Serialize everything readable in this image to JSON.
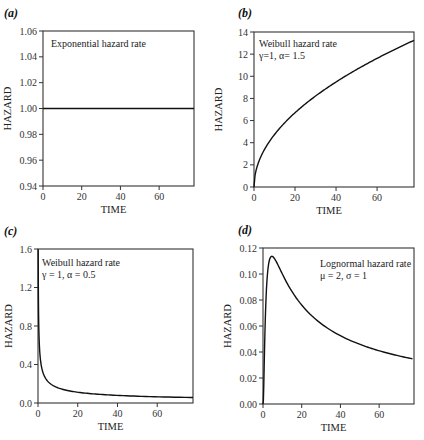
{
  "chart_data": [
    {
      "id": "a",
      "type": "line",
      "panel_label": "(a)",
      "title": "Exponential hazard rate",
      "annotation_lines": [
        "Exponential hazard rate"
      ],
      "xlabel": "TIME",
      "ylabel": "HAZARD",
      "xlim": [
        0,
        78
      ],
      "ylim": [
        0.94,
        1.06
      ],
      "xticks": [
        0,
        20,
        40,
        60
      ],
      "yticks": [
        "0.94",
        "0.96",
        "0.98",
        "1.00",
        "1.02",
        "1.04",
        "1.06"
      ],
      "grid": false,
      "series": [
        {
          "name": "Exponential",
          "formula": "h(t)=1",
          "x": [
            0,
            10,
            20,
            30,
            40,
            50,
            60,
            70,
            78
          ],
          "values": [
            1.0,
            1.0,
            1.0,
            1.0,
            1.0,
            1.0,
            1.0,
            1.0,
            1.0
          ]
        }
      ]
    },
    {
      "id": "b",
      "type": "line",
      "panel_label": "(b)",
      "title": "Weibull hazard rate",
      "annotation_lines": [
        "Weibull hazard rate",
        "γ=1,  α= 1.5"
      ],
      "xlabel": "TIME",
      "ylabel": "HAZARD",
      "xlim": [
        0,
        78
      ],
      "ylim": [
        0,
        14
      ],
      "xticks": [
        0,
        20,
        40,
        60
      ],
      "yticks": [
        "0",
        "2",
        "4",
        "6",
        "8",
        "10",
        "12",
        "14"
      ],
      "grid": false,
      "series": [
        {
          "name": "Weibull γ=1, α=1.5",
          "x": [
            0,
            1,
            2,
            5,
            10,
            20,
            30,
            40,
            50,
            60,
            70,
            78
          ],
          "values": [
            0,
            1.5,
            2.12,
            3.35,
            4.74,
            6.71,
            8.22,
            9.49,
            10.61,
            11.62,
            12.55,
            13.25
          ]
        }
      ]
    },
    {
      "id": "c",
      "type": "line",
      "panel_label": "(c)",
      "title": "Weibull hazard rate",
      "annotation_lines": [
        "Weibull hazard rate",
        "γ = 1, α = 0.5"
      ],
      "xlabel": "TIME",
      "ylabel": "HAZARD",
      "xlim": [
        0,
        78
      ],
      "ylim": [
        0.0,
        1.6
      ],
      "xticks": [
        0,
        20,
        40,
        60
      ],
      "yticks": [
        "0.0",
        "0.4",
        "0.8",
        "1.2",
        "1.6"
      ],
      "grid": false,
      "series": [
        {
          "name": "Weibull γ=1, α=0.5",
          "x": [
            0.1,
            0.2,
            0.5,
            1,
            2,
            5,
            10,
            20,
            30,
            40,
            50,
            60,
            70,
            78
          ],
          "values": [
            1.58,
            1.12,
            0.71,
            0.5,
            0.35,
            0.22,
            0.16,
            0.11,
            0.091,
            0.079,
            0.071,
            0.065,
            0.06,
            0.057
          ]
        }
      ]
    },
    {
      "id": "d",
      "type": "line",
      "panel_label": "(d)",
      "title": "Lognormal hazard rate",
      "annotation_lines": [
        "Lognormal hazard rate",
        "μ = 2, σ = 1"
      ],
      "xlabel": "TIME",
      "ylabel": "HAZARD",
      "xlim": [
        0,
        78
      ],
      "ylim": [
        0.0,
        0.12
      ],
      "xticks": [
        0,
        20,
        40,
        60
      ],
      "yticks": [
        "0.00",
        "0.02",
        "0.04",
        "0.06",
        "0.08",
        "0.10",
        "0.12"
      ],
      "grid": false,
      "series": [
        {
          "name": "Lognormal μ=2, σ=1",
          "x": [
            0,
            0.5,
            1,
            2,
            3,
            4,
            5,
            6,
            8,
            10,
            15,
            20,
            30,
            40,
            50,
            60,
            70,
            78
          ],
          "values": [
            0,
            0.013,
            0.045,
            0.088,
            0.106,
            0.112,
            0.113,
            0.111,
            0.104,
            0.096,
            0.079,
            0.067,
            0.053,
            0.045,
            0.04,
            0.037,
            0.035,
            0.034
          ]
        }
      ]
    }
  ]
}
